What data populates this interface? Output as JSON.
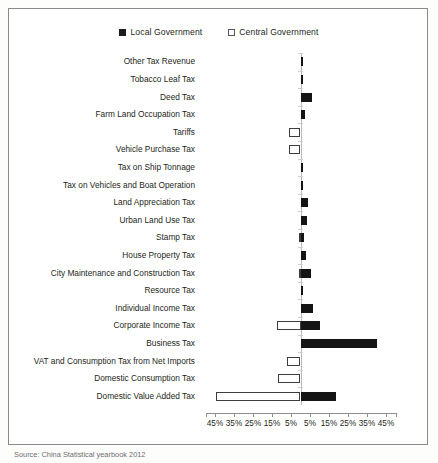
{
  "legend": {
    "items": [
      {
        "label": "Local Government",
        "style": "filled",
        "color": "#1a1a1a",
        "icon": "filled-square-icon"
      },
      {
        "label": "Central Government",
        "style": "hollow",
        "color": "#ffffff",
        "icon": "hollow-square-icon"
      }
    ]
  },
  "caption": {
    "text": "Source: China Statistical yearbook 2012"
  },
  "chart_data": {
    "type": "bar",
    "orientation": "horizontal-diverging",
    "title": "",
    "xlabel": "",
    "ylabel": "",
    "grid": false,
    "legend_position": "top-center",
    "axis": {
      "tick_labels": [
        "45%",
        "35%",
        "25%",
        "15%",
        "5%",
        "5%",
        "15%",
        "25%",
        "35%",
        "45%"
      ],
      "tick_values": [
        -45,
        -35,
        -25,
        -15,
        -5,
        5,
        15,
        25,
        35,
        45
      ],
      "xlim": [
        -50,
        50
      ],
      "zero_at": 0,
      "left_direction_series": "Central Government",
      "right_direction_series": "Local Government"
    },
    "categories": [
      "Other Tax Revenue",
      "Tobacco Leaf Tax",
      "Deed Tax",
      "Farm Land Occupation Tax",
      "Tariffs",
      "Vehicle Purchase Tax",
      "Tax on Ship Tonnage",
      "Tax on Vehicles and Boat Operation",
      "Land Appreciation Tax",
      "Urban Land Use Tax",
      "Stamp Tax",
      "House Property Tax",
      "City Maintenance and Construction Tax",
      "Resource Tax",
      "Individual Income Tax",
      "Corporate Income Tax",
      "Business Tax",
      "VAT and Consumption Tax from Net Imports",
      "Domestic Consumption Tax",
      "Domestic Value Added Tax"
    ],
    "series": [
      {
        "name": "Local Government",
        "color": "#141414",
        "values": [
          0.2,
          0.8,
          6.2,
          2.2,
          0,
          0,
          0.2,
          1.2,
          3.8,
          3.2,
          1.6,
          3.0,
          5.4,
          1.2,
          6.4,
          10.0,
          40.0,
          0,
          0,
          18.5
        ]
      },
      {
        "name": "Central Government",
        "color": "#ffffff",
        "values": [
          0,
          0,
          0,
          0,
          6.0,
          6.0,
          0,
          0,
          0,
          0,
          1.0,
          0,
          0.6,
          0,
          0,
          12.5,
          0,
          7.0,
          12.0,
          44.5
        ]
      }
    ]
  }
}
